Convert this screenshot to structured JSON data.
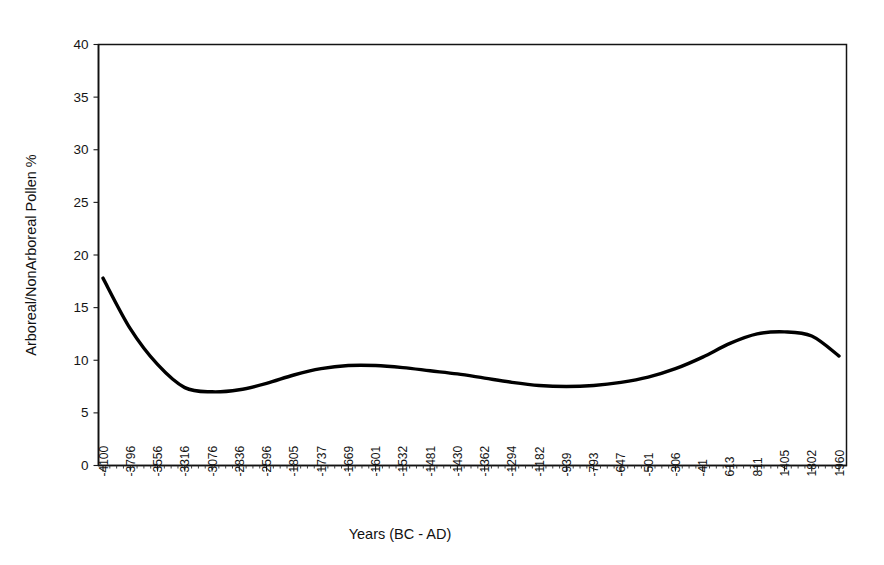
{
  "chart_data": {
    "type": "line",
    "title": "",
    "xlabel": "Years (BC - AD)",
    "ylabel": "Arboreal/NonArboreal Pollen %",
    "ylim": [
      0,
      40
    ],
    "ytick_step": 5,
    "yticks": [
      "0",
      "5",
      "10",
      "15",
      "20",
      "25",
      "30",
      "35",
      "40"
    ],
    "grid": false,
    "legend": "none",
    "line_color": "#000000",
    "categories": [
      "-4100",
      "-3796",
      "-3556",
      "-3316",
      "-3076",
      "-2836",
      "-2596",
      "-1805",
      "-1737",
      "-1669",
      "-1601",
      "-1532",
      "-1481",
      "-1430",
      "-1362",
      "-1294",
      "-1182",
      "-939",
      "-793",
      "-647",
      "-501",
      "-306",
      "-41",
      "613",
      "811",
      "1405",
      "1802",
      "1960"
    ],
    "series": [
      {
        "name": "Arboreal/NonArboreal Pollen %",
        "values": [
          17.8,
          13.0,
          9.6,
          7.4,
          7.0,
          7.2,
          7.8,
          8.6,
          9.2,
          9.5,
          9.5,
          9.3,
          9.0,
          8.7,
          8.3,
          7.9,
          7.6,
          7.5,
          7.6,
          7.9,
          8.4,
          9.2,
          10.3,
          11.6,
          12.5,
          12.7,
          12.3,
          10.4
        ]
      }
    ],
    "first_value": 17.8,
    "min_value": 7.0,
    "max_value": 17.8,
    "last_value": 10.4
  }
}
